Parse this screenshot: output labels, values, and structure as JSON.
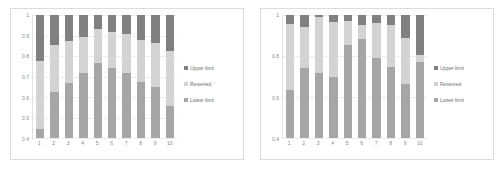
{
  "colors": {
    "upper_limit": "#808080",
    "reserved": "#d3d3d3",
    "lower_limit": "#a6a6a6",
    "grid": "#ededed",
    "axis_text": "#8a8a8a",
    "frame": "#dcdcdc",
    "background": "#ffffff"
  },
  "legend": {
    "items": [
      {
        "label": "Upper limit",
        "marker": "square-marker",
        "color": "#808080"
      },
      {
        "label": "Reserved",
        "marker": "square-marker",
        "color": "#d3d3d3"
      },
      {
        "label": "Lower limit",
        "marker": "square-marker",
        "color": "#a6a6a6"
      }
    ]
  },
  "charts": [
    {
      "id": "left",
      "name": "left-chart",
      "yticks": [
        "1",
        "0.9",
        "0.8",
        "0.7",
        "0.6",
        "0.5",
        "0.4"
      ],
      "xticks": [
        "1",
        "2",
        "3",
        "4",
        "5",
        "6",
        "7",
        "8",
        "9",
        "10"
      ]
    },
    {
      "id": "right",
      "name": "right-chart",
      "yticks": [
        "1",
        "0.8",
        "0.6",
        "0.4"
      ],
      "xticks": [
        "1",
        "2",
        "3",
        "4",
        "5",
        "6",
        "7",
        "8",
        "9",
        "10"
      ]
    }
  ],
  "chart_data": [
    {
      "type": "bar",
      "subtype": "stacked-bar",
      "title": "",
      "xlabel": "",
      "ylabel": "",
      "ylim": [
        0.4,
        1.0
      ],
      "yticks": [
        0.4,
        0.5,
        0.6,
        0.7,
        0.8,
        0.9,
        1.0
      ],
      "grid": true,
      "legend": "right",
      "categories": [
        "1",
        "2",
        "3",
        "4",
        "5",
        "6",
        "7",
        "8",
        "9",
        "10"
      ],
      "series": [
        {
          "name": "Lower limit",
          "color": "#a6a6a6",
          "values": [
            0.445,
            0.625,
            0.668,
            0.715,
            0.765,
            0.742,
            0.718,
            0.672,
            0.648,
            0.558
          ]
        },
        {
          "name": "Reserved",
          "color": "#d3d3d3",
          "values": [
            0.775,
            0.852,
            0.872,
            0.895,
            0.93,
            0.915,
            0.905,
            0.878,
            0.862,
            0.822
          ]
        },
        {
          "name": "Upper limit",
          "color": "#808080",
          "values": [
            1.0,
            1.0,
            1.0,
            1.0,
            1.0,
            1.0,
            1.0,
            1.0,
            1.0,
            1.0
          ]
        }
      ],
      "notes": "Cumulative stacked values: lower-limit boundary, reserved boundary, upper limit at 1."
    },
    {
      "type": "bar",
      "subtype": "stacked-bar",
      "title": "",
      "xlabel": "",
      "ylabel": "",
      "ylim": [
        0.4,
        1.0
      ],
      "yticks": [
        0.4,
        0.6,
        0.8,
        1.0
      ],
      "grid": true,
      "legend": "right",
      "categories": [
        "1",
        "2",
        "3",
        "4",
        "5",
        "6",
        "7",
        "8",
        "9",
        "10"
      ],
      "series": [
        {
          "name": "Lower limit",
          "color": "#a6a6a6",
          "values": [
            0.632,
            0.742,
            0.718,
            0.698,
            0.852,
            0.882,
            0.788,
            0.748,
            0.662,
            0.772
          ]
        },
        {
          "name": "Reserved",
          "color": "#d3d3d3",
          "values": [
            0.958,
            0.942,
            0.988,
            0.968,
            0.972,
            0.952,
            0.962,
            0.952,
            0.888,
            0.805
          ]
        },
        {
          "name": "Upper limit",
          "color": "#808080",
          "values": [
            1.0,
            1.0,
            1.0,
            1.0,
            1.0,
            1.0,
            1.0,
            1.0,
            1.0,
            1.0
          ]
        }
      ],
      "notes": "Cumulative stacked values: lower-limit boundary, reserved boundary, upper limit at 1."
    }
  ]
}
